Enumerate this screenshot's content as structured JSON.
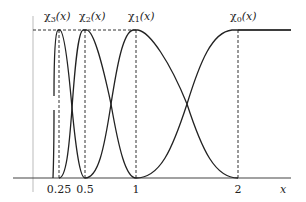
{
  "diagram": {
    "title": "",
    "functions": [
      {
        "name": "chi3",
        "label": "χ₃(x)",
        "label_base": "χ",
        "label_sub": "3",
        "label_arg": "(x)",
        "peak": 0.25
      },
      {
        "name": "chi2",
        "label": "χ₂(x)",
        "label_base": "χ",
        "label_sub": "2",
        "label_arg": "(x)",
        "peak": 0.5
      },
      {
        "name": "chi1",
        "label": "χ₁(x)",
        "label_base": "χ",
        "label_sub": "1",
        "label_arg": "(x)",
        "peak": 1
      },
      {
        "name": "chi0",
        "label": "χ₀(x)",
        "label_base": "χ",
        "label_sub": "0",
        "label_arg": "(x)",
        "peak": 2
      }
    ],
    "x_ticks": [
      {
        "value": 0.25,
        "label": "0.25"
      },
      {
        "value": 0.5,
        "label": "0.5"
      },
      {
        "value": 1,
        "label": "1"
      },
      {
        "value": 2,
        "label": "2"
      }
    ],
    "x_axis_label": "x",
    "line_color": "#222222",
    "background": "#ffffff"
  }
}
